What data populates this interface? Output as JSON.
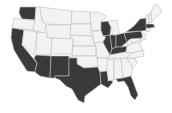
{
  "map": {
    "type": "choropleth",
    "region": "United States (contiguous)",
    "colors": {
      "highlighted": "#3a3a3a",
      "default": "#f2f2f2",
      "border": "#bdbdbd",
      "background": "#ffffff"
    },
    "highlighted_states": [
      "WA",
      "CA",
      "AZ",
      "NM",
      "TX",
      "LA",
      "FL",
      "WI",
      "IL",
      "IN",
      "KY",
      "OH",
      "PA",
      "NY",
      "MA"
    ],
    "states": [
      {
        "id": "WA",
        "d": "M20,7 L36,7 L35,20 L22,19 L19,13 Z"
      },
      {
        "id": "OR",
        "d": "M14,18 L22,19 L35,20 L33,30 L12,28 Z"
      },
      {
        "id": "CA",
        "d": "M12,28 L24,30 L22,45 L37,63 L35,72 L27,71 L20,60 L14,50 L11,38 Z"
      },
      {
        "id": "NV",
        "d": "M24,30 L37,32 L34,55 L22,45 Z"
      },
      {
        "id": "ID",
        "d": "M36,7 L40,7 L42,20 L46,25 L44,33 L33,30 L35,20 Z"
      },
      {
        "id": "MT",
        "d": "M40,7 L72,11 L71,25 L46,24 L42,20 Z"
      },
      {
        "id": "WY",
        "d": "M46,25 L71,25 L70,39 L47,38 Z"
      },
      {
        "id": "UT",
        "d": "M37,32 L47,33 L47,38 L52,38 L51,55 L36,55 Z"
      },
      {
        "id": "CO",
        "d": "M52,38 L73,39 L72,54 L51,54 Z"
      },
      {
        "id": "AZ",
        "d": "M36,55 L51,56 L50,78 L40,76 L35,72 L37,63 L34,58 Z"
      },
      {
        "id": "NM",
        "d": "M51,56 L69,56 L69,76 L55,76 L55,78 L50,78 Z"
      },
      {
        "id": "ND",
        "d": "M72,11 L90,12 L91,24 L71,24 Z"
      },
      {
        "id": "SD",
        "d": "M71,24 L91,24 L91,36 L70,35 Z"
      },
      {
        "id": "NE",
        "d": "M70,35 L92,36 L95,46 L73,46 L73,40 Z"
      },
      {
        "id": "KS",
        "d": "M73,46 L96,46 L96,56 L72,56 Z"
      },
      {
        "id": "OK",
        "d": "M69,56 L97,56 L98,67 L84,68 L77,64 L77,58 L69,58 Z"
      },
      {
        "id": "TX",
        "d": "M69,58 L77,58 L77,64 L84,68 L98,67 L100,72 L101,84 L93,90 L85,96 L84,103 L78,100 L72,89 L66,86 L60,80 L55,78 L55,76 L69,76 Z"
      },
      {
        "id": "MN",
        "d": "M90,12 L98,12 L107,16 L101,22 L101,30 L92,31 L91,24 Z"
      },
      {
        "id": "IA",
        "d": "M92,31 L103,31 L106,37 L103,42 L94,43 Z"
      },
      {
        "id": "MO",
        "d": "M94,43 L103,42 L106,48 L110,55 L108,58 L97,58 L96,46 Z"
      },
      {
        "id": "AR",
        "d": "M97,58 L108,58 L107,71 L100,72 L98,67 Z"
      },
      {
        "id": "LA",
        "d": "M100,72 L107,71 L108,78 L113,82 L108,88 L101,84 Z"
      },
      {
        "id": "WI",
        "d": "M101,22 L108,21 L111,27 L110,35 L103,36 L101,30 Z"
      },
      {
        "id": "IL",
        "d": "M103,36 L110,35 L112,49 L110,55 L106,48 L103,42 L106,37 Z"
      },
      {
        "id": "MI",
        "d": "M108,21 L117,20 L118,27 L120,35 L113,36 L111,27 Z"
      },
      {
        "id": "IN",
        "d": "M110,35 L116,35 L116,47 L112,49 Z"
      },
      {
        "id": "OH",
        "d": "M116,35 L124,33 L127,42 L121,47 L116,47 Z"
      },
      {
        "id": "KY",
        "d": "M112,49 L116,47 L121,47 L127,46 L126,52 L110,55 Z"
      },
      {
        "id": "TN",
        "d": "M108,58 L110,55 L126,52 L131,53 L127,58 Z"
      },
      {
        "id": "MS",
        "d": "M107,60 L114,59 L114,80 L108,81 L108,78 L107,71 Z"
      },
      {
        "id": "AL",
        "d": "M114,59 L121,59 L123,78 L116,79 L114,80 Z"
      },
      {
        "id": "GA",
        "d": "M121,59 L127,58 L133,68 L131,76 L123,78 Z"
      },
      {
        "id": "FL",
        "d": "M116,79 L123,78 L131,76 L134,84 L138,95 L135,100 L131,96 L128,87 L124,81 L118,82 Z"
      },
      {
        "id": "SC",
        "d": "M127,58 L135,58 L137,63 L133,68 Z"
      },
      {
        "id": "NC",
        "d": "M127,58 L131,53 L143,50 L144,56 L135,58 Z"
      },
      {
        "id": "VA",
        "d": "M126,52 L127,46 L133,43 L138,42 L143,50 L131,53 Z"
      },
      {
        "id": "WV",
        "d": "M127,42 L130,39 L133,43 L127,46 Z"
      },
      {
        "id": "PA",
        "d": "M124,33 L141,31 L143,38 L130,39 L127,42 Z"
      },
      {
        "id": "NY",
        "d": "M126,32 L134,26 L140,19 L146,18 L148,30 L142,31 L141,31 Z"
      },
      {
        "id": "MD",
        "d": "M133,43 L138,40 L141,40 L140,44 L138,42 Z"
      },
      {
        "id": "NJ",
        "d": "M143,33 L146,34 L145,40 L142,38 Z"
      },
      {
        "id": "DE",
        "d": "M141,38 L142,38 L142,42 L141,41 Z"
      },
      {
        "id": "CT",
        "d": "M146,28 L150,28 L150,31 L146,32 Z"
      },
      {
        "id": "MA",
        "d": "M146,24 L153,24 L155,27 L150,28 L146,28 Z"
      },
      {
        "id": "VT",
        "d": "M146,15 L149,15 L149,23 L146,24 Z"
      },
      {
        "id": "NH",
        "d": "M149,13 L151,12 L152,22 L149,23 Z"
      },
      {
        "id": "ME",
        "d": "M151,12 L154,5 L158,5 L162,12 L155,18 L152,22 Z"
      }
    ]
  }
}
